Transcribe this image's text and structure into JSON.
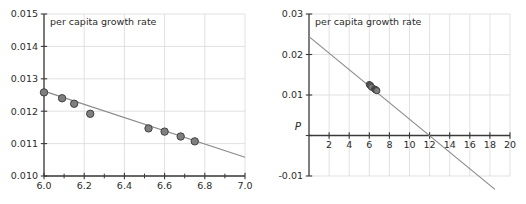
{
  "figure": {
    "name": "per-capita-growth-rate-figure",
    "panel_count": 2,
    "background_color": "#ffffff",
    "axis_color": "#3a3a3a",
    "grid_color": "#d9d9d9",
    "fit_line_color": "#8a8a8a",
    "marker_fill_color": "#7f7f7f",
    "marker_edge_color": "#404040"
  },
  "chart_data": [
    {
      "panel": "left",
      "type": "scatter",
      "title": "per capita growth rate",
      "xlabel": "",
      "ylabel": "",
      "xlim": [
        6.0,
        7.0
      ],
      "ylim": [
        0.01,
        0.015
      ],
      "grid": true,
      "legend": "none",
      "xticks": [
        6.0,
        6.2,
        6.4,
        6.6,
        6.8,
        7.0
      ],
      "xticklabels": [
        "6.0",
        "6.2",
        "6.4",
        "6.6",
        "6.8",
        "7.0"
      ],
      "xminorticks": [
        6.1,
        6.3,
        6.5,
        6.7,
        6.9
      ],
      "yticks": [
        0.01,
        0.011,
        0.012,
        0.013,
        0.014,
        0.015
      ],
      "yticklabels": [
        "0.010",
        "0.011",
        "0.012",
        "0.013",
        "0.014",
        "0.015"
      ],
      "series": [
        {
          "name": "data points",
          "marker": "circle",
          "x": [
            6.0,
            6.09,
            6.15,
            6.23,
            6.52,
            6.6,
            6.68,
            6.75
          ],
          "y": [
            0.01258,
            0.0124,
            0.01223,
            0.01192,
            0.01147,
            0.01137,
            0.01122,
            0.01107
          ]
        },
        {
          "name": "fit line",
          "marker": "none",
          "x": [
            6.0,
            7.0
          ],
          "y": [
            0.01262,
            0.01058
          ]
        }
      ]
    },
    {
      "panel": "right",
      "type": "scatter",
      "title": "per capita growth rate",
      "xlabel": "P",
      "ylabel": "",
      "xlim": [
        0,
        20
      ],
      "ylim": [
        -0.01,
        0.03
      ],
      "grid": true,
      "legend": "none",
      "xticks": [
        2,
        4,
        6,
        8,
        10,
        12,
        14,
        16,
        18,
        20
      ],
      "xticklabels": [
        "2",
        "4",
        "6",
        "8",
        "10",
        "12",
        "14",
        "16",
        "18",
        "20"
      ],
      "yticks": [
        -0.01,
        0.0,
        0.01,
        0.02,
        0.03
      ],
      "yticklabels": [
        "-0.01",
        "",
        "0.01",
        "0.02",
        "0.03"
      ],
      "axis_origin_label": "P",
      "series": [
        {
          "name": "data points",
          "marker": "circle",
          "x": [
            6.0,
            6.09,
            6.15,
            6.23,
            6.52,
            6.6,
            6.68,
            6.75
          ],
          "y": [
            0.01258,
            0.0124,
            0.01223,
            0.01192,
            0.01147,
            0.01137,
            0.01122,
            0.01107
          ]
        },
        {
          "name": "fit line",
          "marker": "none",
          "x": [
            0,
            18.5
          ],
          "y": [
            0.02442,
            -0.01331
          ]
        }
      ]
    }
  ]
}
